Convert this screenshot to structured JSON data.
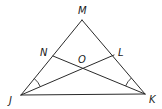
{
  "diagram": {
    "type": "geometry-triangle",
    "points": {
      "M": {
        "label": "M",
        "x": 82,
        "y": 20
      },
      "J": {
        "label": "J",
        "x": 21,
        "y": 95
      },
      "K": {
        "label": "K",
        "x": 145,
        "y": 94
      },
      "N": {
        "label": "N",
        "x": 53,
        "y": 56
      },
      "L": {
        "label": "L",
        "x": 114,
        "y": 55
      },
      "O": {
        "label": "O",
        "x": 83,
        "y": 68
      }
    },
    "labels": {
      "M": "M",
      "N": "N",
      "L": "L",
      "O": "O",
      "J": "J",
      "K": "K"
    },
    "segments": [
      [
        "M",
        "J"
      ],
      [
        "M",
        "K"
      ],
      [
        "J",
        "K"
      ],
      [
        "J",
        "L"
      ],
      [
        "K",
        "N"
      ]
    ],
    "congruent_angle_marks": [
      {
        "vertex": "J",
        "between": [
          "M",
          "L"
        ]
      },
      {
        "vertex": "K",
        "between": [
          "M",
          "N"
        ]
      }
    ],
    "colors": {
      "stroke": "#2a2a2a",
      "background": "#ffffff"
    }
  }
}
